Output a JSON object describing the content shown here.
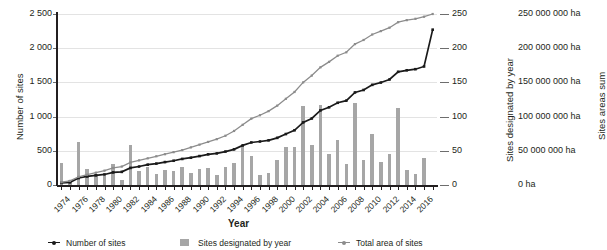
{
  "chart_data": {
    "type": "bar",
    "title": "",
    "xlabel": "Year",
    "ylabel": "Number of sites",
    "ylabel_right1": "Sites designated by year",
    "ylabel_right2": "Sites areas sum",
    "grid": true,
    "legend_position": "bottom",
    "ylim": [
      0,
      2500
    ],
    "ylim_right1": [
      0,
      250
    ],
    "ylim_right2": [
      0,
      250000000
    ],
    "ytick_labels": [
      "2 500",
      "2 000",
      "1 500",
      "1 000",
      "500",
      "0"
    ],
    "ytick_values": [
      2500,
      2000,
      1500,
      1000,
      500,
      0
    ],
    "ytick_labels_right1": [
      "250",
      "200",
      "150",
      "100",
      "50",
      "0"
    ],
    "ytick_values_right1": [
      250,
      200,
      150,
      100,
      50,
      0
    ],
    "ytick_labels_right2": [
      "250 000 000 ha",
      "200 000 000 ha",
      "150 000 000 ha",
      "100 000 000 ha",
      "50 000 000 ha",
      "0 ha"
    ],
    "ytick_values_right2": [
      250000000,
      200000000,
      150000000,
      100000000,
      50000000,
      0
    ],
    "categories": [
      1974,
      1975,
      1976,
      1977,
      1978,
      1979,
      1980,
      1981,
      1982,
      1983,
      1984,
      1985,
      1986,
      1987,
      1988,
      1989,
      1990,
      1991,
      1992,
      1993,
      1994,
      1995,
      1996,
      1997,
      1998,
      1999,
      2000,
      2001,
      2002,
      2003,
      2004,
      2005,
      2006,
      2007,
      2008,
      2009,
      2010,
      2011,
      2012,
      2013,
      2014,
      2015,
      2016,
      2017
    ],
    "xtick_labels": [
      "1974",
      "1976",
      "1978",
      "1980",
      "1982",
      "1984",
      "1986",
      "1988",
      "1990",
      "1992",
      "1994",
      "1996",
      "1998",
      "2000",
      "2002",
      "2004",
      "2006",
      "2008",
      "2010",
      "2012",
      "2014",
      "2016"
    ],
    "series": [
      {
        "name": "Sites designated by year",
        "type": "bar",
        "axis": "right1",
        "color": "#a6a6a6",
        "values": [
          32,
          8,
          63,
          23,
          16,
          13,
          30,
          8,
          58,
          20,
          27,
          16,
          22,
          20,
          26,
          18,
          24,
          25,
          14,
          27,
          32,
          58,
          43,
          14,
          17,
          36,
          56,
          55,
          115,
          58,
          117,
          46,
          66,
          31,
          120,
          36,
          75,
          34,
          45,
          112,
          22,
          16,
          40,
          0
        ]
      },
      {
        "name": "Number of sites",
        "type": "line",
        "axis": "left",
        "color": "#1a1a1a",
        "values": [
          31,
          39,
          102,
          125,
          141,
          154,
          184,
          192,
          250,
          270,
          297,
          313,
          335,
          355,
          381,
          399,
          423,
          448,
          462,
          489,
          521,
          579,
          622,
          636,
          653,
          689,
          745,
          800,
          915,
          973,
          1090,
          1136,
          1202,
          1233,
          1353,
          1389,
          1464,
          1498,
          1543,
          1655,
          1677,
          1693,
          1733,
          2271
        ]
      },
      {
        "name": "Total area of sites",
        "type": "line",
        "axis": "right2",
        "color": "#8c8c8c",
        "values": [
          4000000,
          6000000,
          12000000,
          15000000,
          18000000,
          21000000,
          25000000,
          27000000,
          33000000,
          36000000,
          39000000,
          42000000,
          45000000,
          48000000,
          51000000,
          55000000,
          59000000,
          63000000,
          67000000,
          72000000,
          79000000,
          88000000,
          97000000,
          102000000,
          108000000,
          116000000,
          126000000,
          136000000,
          150000000,
          160000000,
          172000000,
          180000000,
          189000000,
          194000000,
          206000000,
          212000000,
          220000000,
          225000000,
          230000000,
          238000000,
          241000000,
          243000000,
          246000000,
          250000000
        ]
      }
    ],
    "legend": [
      {
        "label": "Number of sites",
        "marker": "line-dot",
        "color": "#1a1a1a"
      },
      {
        "label": "Sites designated by year",
        "marker": "square",
        "color": "#a6a6a6"
      },
      {
        "label": "Total area of sites",
        "marker": "line-dot",
        "color": "#8c8c8c"
      }
    ]
  }
}
